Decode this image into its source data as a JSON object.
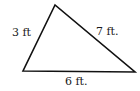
{
  "figure": {
    "shape": "triangle",
    "stroke_color": "#111111",
    "sides": [
      {
        "name": "left",
        "label": "3 ft"
      },
      {
        "name": "right",
        "label": "7 ft."
      },
      {
        "name": "bottom",
        "label": "6 ft."
      }
    ]
  }
}
